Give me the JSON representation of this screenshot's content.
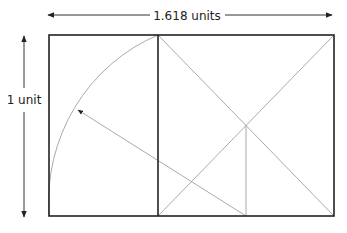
{
  "diagram": {
    "width_label": "1.618 units",
    "height_label": "1 unit",
    "colors": {
      "outline": "#222222",
      "construction": "#999999",
      "text": "#222222",
      "background": "#ffffff"
    },
    "elements": [
      "outer-golden-rectangle",
      "square-divider",
      "square-diagonals",
      "midpoint-vertical",
      "radius-arrow",
      "arc"
    ]
  }
}
